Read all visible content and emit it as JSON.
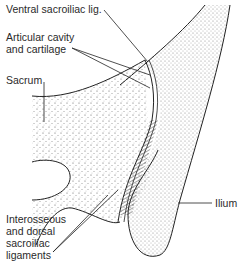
{
  "diagram": {
    "type": "anatomical-illustration",
    "labels": {
      "ventral_lig": "Ventral sacroiliac lig.",
      "articular_1": "Articular cavity",
      "articular_2": "and cartilage",
      "sacrum": "Sacrum",
      "ilium": "Ilium",
      "interosseous_1": "Interosseous",
      "interosseous_2": "and dorsal",
      "interosseous_3": "sacroiliac",
      "interosseous_4": "ligaments"
    },
    "caption": "",
    "colors": {
      "line": "#222222",
      "stipple": "#444444",
      "background": "#ffffff"
    }
  }
}
